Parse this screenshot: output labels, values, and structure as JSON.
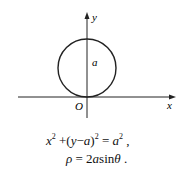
{
  "diagram": {
    "axes": {
      "x_label": "x",
      "y_label": "y",
      "origin_label": "O"
    },
    "circle": {
      "radius_label": "a",
      "center": "(0, a)",
      "tangent_at": "origin"
    },
    "equations": {
      "cartesian": {
        "x": "x",
        "exp1": "2",
        "plus": " +(",
        "y": "y",
        "minus": "−",
        "a": "a",
        "close": ")",
        "exp2": "2",
        "eq": " = ",
        "a2": "a",
        "exp3": "2",
        "end": " ,"
      },
      "polar": {
        "rho": "ρ",
        "eq": " = 2",
        "a": "a",
        "sin": "sin",
        "theta": "θ",
        "end": " ."
      }
    }
  }
}
